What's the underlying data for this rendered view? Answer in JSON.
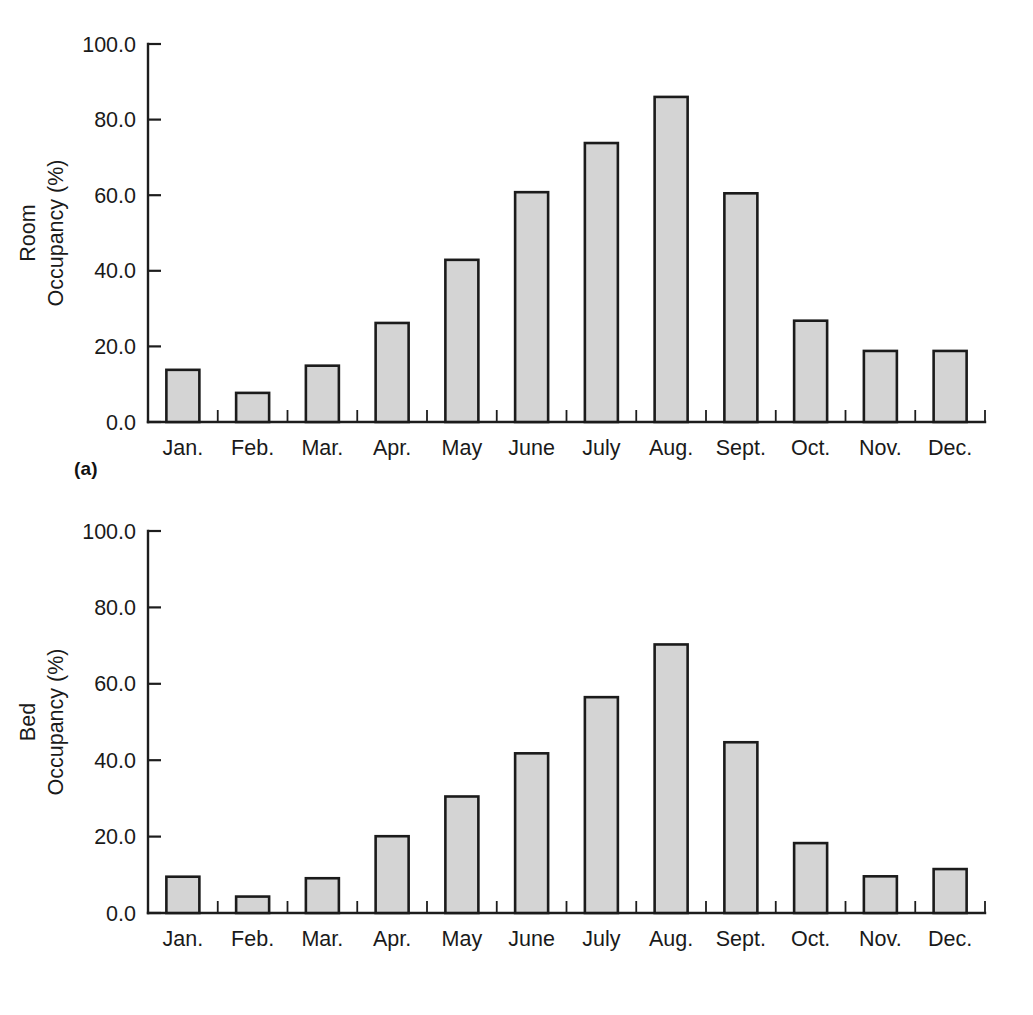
{
  "figure": {
    "background_color": "#ffffff",
    "bar_fill_color": "#d4d4d4",
    "bar_stroke_color": "#1b1b1b",
    "axis_color": "#1d1d1d"
  },
  "panels": [
    {
      "caption": "(a)",
      "ylabel_line1": "Room",
      "ylabel_line2": "Occupancy (%)"
    },
    {
      "caption": "(b)",
      "ylabel_line1": "Bed",
      "ylabel_line2": "Occupancy (%)"
    }
  ],
  "chart_data": [
    {
      "type": "bar",
      "title": "",
      "panel_label": "(a)",
      "xlabel": "",
      "ylabel": "Room Occupancy (%)",
      "categories": [
        "Jan.",
        "Feb.",
        "Mar.",
        "Apr.",
        "May",
        "June",
        "July",
        "Aug.",
        "Sept.",
        "Oct.",
        "Nov.",
        "Dec."
      ],
      "values": [
        13.8,
        7.7,
        14.9,
        26.2,
        42.9,
        60.8,
        73.8,
        86.0,
        60.5,
        26.8,
        18.8,
        18.8
      ],
      "ylim": [
        0,
        100
      ],
      "yticks": [
        0,
        20,
        40,
        60,
        80,
        100
      ],
      "ytick_labels": [
        "0.0",
        "20.0",
        "40.0",
        "60.0",
        "80.0",
        "100.0"
      ],
      "grid": false,
      "legend": "none"
    },
    {
      "type": "bar",
      "title": "",
      "panel_label": "(b)",
      "xlabel": "",
      "ylabel": "Bed Occupancy (%)",
      "categories": [
        "Jan.",
        "Feb.",
        "Mar.",
        "Apr.",
        "May",
        "June",
        "July",
        "Aug.",
        "Sept.",
        "Oct.",
        "Nov.",
        "Dec."
      ],
      "values": [
        9.5,
        4.3,
        9.1,
        20.1,
        30.5,
        41.8,
        56.5,
        70.3,
        44.7,
        18.3,
        9.6,
        11.5
      ],
      "ylim": [
        0,
        100
      ],
      "yticks": [
        0,
        20,
        40,
        60,
        80,
        100
      ],
      "ytick_labels": [
        "0.0",
        "20.0",
        "40.0",
        "60.0",
        "80.0",
        "100.0"
      ],
      "grid": false,
      "legend": "none"
    }
  ]
}
